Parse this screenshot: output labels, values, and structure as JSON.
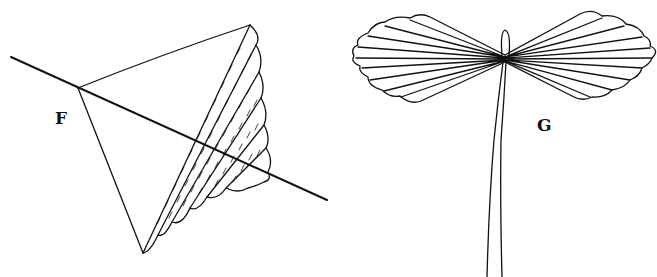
{
  "figures": [
    {
      "id": "F",
      "label": "F",
      "description": "triangular pleated fold with crossing line"
    },
    {
      "id": "G",
      "label": "G",
      "description": "fan-folded bow-tie shape tied at center with two hanging strings"
    }
  ],
  "colors": {
    "ink": "#111111",
    "background": "#ffffff"
  }
}
